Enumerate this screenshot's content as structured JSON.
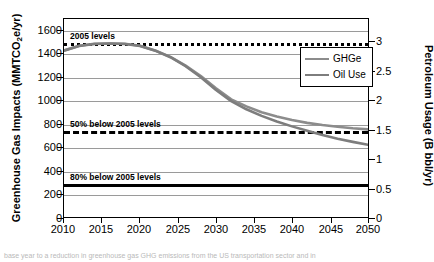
{
  "chart_data": {
    "type": "line",
    "title": "",
    "xlabel": "",
    "ylabel": "Greenhouse Gas Impacts (MMTCO2e/yr)",
    "ylabel_right": "Petroleum Usage (B bbl/yr)",
    "xlim": [
      2010,
      2050
    ],
    "ylim": [
      0,
      1700
    ],
    "ylim_right": [
      0,
      3.4
    ],
    "grid": true,
    "legend_position": "upper right",
    "xticks": [
      "2010",
      "2015",
      "2020",
      "2025",
      "2030",
      "2035",
      "2040",
      "2045",
      "2050"
    ],
    "yticks_left": [
      "0",
      "200",
      "400",
      "600",
      "800",
      "1000",
      "1200",
      "1400",
      "1600"
    ],
    "yticks_right": [
      "0",
      "0.5",
      "1",
      "1.5",
      "2",
      "2.5",
      "3"
    ],
    "x": [
      2010,
      2012,
      2014,
      2016,
      2018,
      2020,
      2022,
      2024,
      2026,
      2028,
      2030,
      2032,
      2034,
      2036,
      2038,
      2040,
      2042,
      2044,
      2046,
      2048,
      2050
    ],
    "series": [
      {
        "name": "GHGe",
        "color": "#8c8c8c",
        "values": [
          1430,
          1470,
          1487,
          1490,
          1487,
          1470,
          1430,
          1375,
          1300,
          1210,
          1105,
          1010,
          950,
          900,
          862,
          832,
          808,
          790,
          775,
          762,
          752
        ]
      },
      {
        "name": "Oil Use",
        "color": "#7d7d7d",
        "values": [
          1428,
          1468,
          1486,
          1490,
          1486,
          1468,
          1428,
          1372,
          1295,
          1200,
          1090,
          995,
          925,
          868,
          820,
          778,
          740,
          705,
          672,
          645,
          620
        ]
      }
    ],
    "reference_lines": [
      {
        "label": "2005 levels",
        "value": 1500,
        "style": "dotted",
        "color": "#000000"
      },
      {
        "label": "50% below 2005 levels",
        "value": 750,
        "style": "dashed",
        "color": "#000000"
      },
      {
        "label": "80% below 2005 levels",
        "value": 300,
        "style": "solid",
        "color": "#000000"
      }
    ]
  },
  "legend": {
    "items": [
      {
        "label": "GHGe"
      },
      {
        "label": "Oil Use"
      }
    ]
  },
  "caption": {
    "text": "base year to a reduction in greenhouse gas GHG emissions from the US transportation sector and in"
  }
}
